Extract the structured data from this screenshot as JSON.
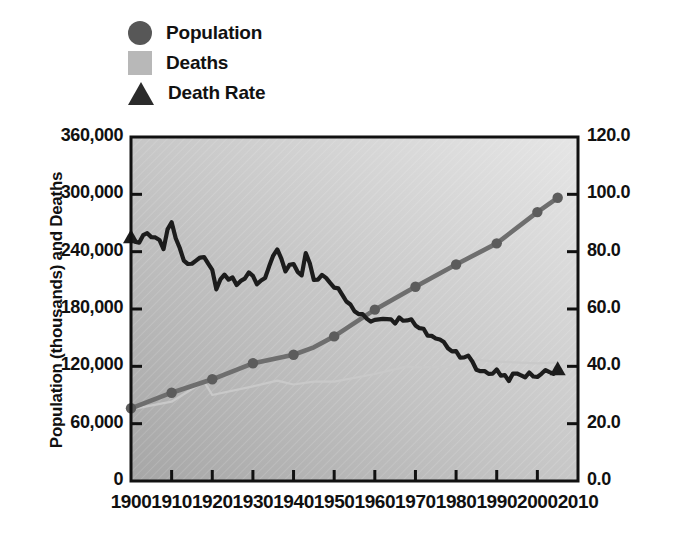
{
  "legend": {
    "items": [
      {
        "label": "Population",
        "marker": "circle-marker-icon",
        "color": "#575757"
      },
      {
        "label": "Deaths",
        "marker": "square-marker-icon",
        "color": "#b8b8b8"
      },
      {
        "label": "Death Rate",
        "marker": "triangle-marker-icon",
        "color": "#2b2b2b"
      }
    ]
  },
  "axes": {
    "left_title": "Population (thousands) and Deaths",
    "right_title": "Deaths per 100,000 Population",
    "left_ticks": [
      "0",
      "60,000",
      "120,000",
      "180,000",
      "240,000",
      "300,000",
      "360,000"
    ],
    "right_ticks": [
      "0.0",
      "20.0",
      "40.0",
      "60.0",
      "80.0",
      "100.0",
      "120.0"
    ],
    "x_ticks": [
      "1900",
      "1910",
      "1920",
      "1930",
      "1940",
      "1950",
      "1960",
      "1970",
      "1980",
      "1990",
      "2000",
      "2010"
    ]
  },
  "colors": {
    "population_line": "#6e6e6e",
    "deaths_line": "#c9c9c9",
    "death_rate_line": "#1c1c1c",
    "plot_bg_light": "#e3e3e3",
    "plot_bg_dark": "#a6a6a6",
    "axis": "#111111"
  },
  "chart_data": {
    "type": "line",
    "title": "",
    "xlabel": "",
    "ylabel": "Population (thousands) and Deaths",
    "y2label": "Deaths per 100,000 Population",
    "xlim": [
      1900,
      2010
    ],
    "ylim": [
      0,
      360000
    ],
    "y2lim": [
      0.0,
      120.0
    ],
    "grid": false,
    "legend_position": "top-left",
    "series": [
      {
        "name": "Population",
        "axis": "left",
        "units": "thousands",
        "marker": "circle",
        "marker_years": [
          1900,
          1910,
          1920,
          1930,
          1940,
          1950,
          1960,
          1970,
          1980,
          1990,
          2000,
          2005
        ],
        "x": [
          1900,
          1910,
          1920,
          1930,
          1940,
          1945,
          1950,
          1960,
          1970,
          1980,
          1990,
          2000,
          2005
        ],
        "values": [
          76094,
          92407,
          106461,
          123188,
          132122,
          139928,
          151325,
          179323,
          203302,
          226542,
          248710,
          281422,
          296410
        ]
      },
      {
        "name": "Deaths",
        "axis": "left",
        "units": "counts",
        "x": [
          1900,
          1910,
          1918,
          1920,
          1930,
          1936,
          1940,
          1945,
          1950,
          1960,
          1968,
          1970,
          1980,
          1985,
          1990,
          2000,
          2005
        ],
        "values": [
          75000,
          83000,
          104000,
          90000,
          99000,
          105000,
          101000,
          104000,
          104000,
          112000,
          120000,
          119000,
          120000,
          127000,
          125000,
          123000,
          124000
        ]
      },
      {
        "name": "Death Rate",
        "axis": "right",
        "units": "deaths per 100,000 population",
        "marker": "triangle",
        "marker_years": [
          1900,
          2005
        ],
        "x": [
          1900,
          1902,
          1904,
          1906,
          1908,
          1910,
          1912,
          1914,
          1916,
          1918,
          1920,
          1921,
          1923,
          1925,
          1927,
          1929,
          1931,
          1933,
          1936,
          1938,
          1940,
          1942,
          1943,
          1945,
          1947,
          1950,
          1953,
          1955,
          1957,
          1960,
          1963,
          1965,
          1968,
          1970,
          1972,
          1975,
          1978,
          1980,
          1983,
          1985,
          1988,
          1990,
          1993,
          1995,
          1998,
          2000,
          2002,
          2005
        ],
        "values": [
          85.0,
          83.0,
          86.0,
          84.0,
          82.0,
          91.0,
          80.0,
          76.0,
          78.0,
          77.0,
          73.0,
          68.0,
          72.0,
          70.0,
          69.0,
          74.0,
          68.0,
          70.0,
          82.0,
          74.0,
          76.0,
          71.0,
          80.0,
          70.0,
          72.0,
          68.0,
          63.0,
          59.0,
          58.0,
          56.0,
          57.0,
          56.0,
          57.0,
          54.0,
          52.0,
          50.0,
          47.0,
          45.0,
          43.0,
          39.0,
          38.0,
          38.0,
          36.0,
          37.0,
          37.0,
          37.0,
          38.0,
          39.0
        ]
      }
    ]
  }
}
